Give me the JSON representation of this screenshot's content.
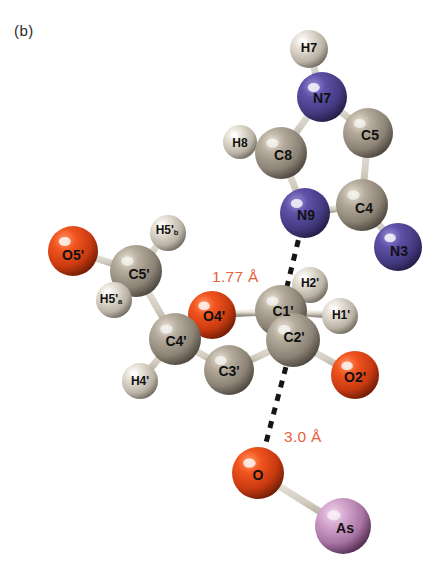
{
  "figure": {
    "panel_label": "(b)",
    "type": "ball-and-stick molecular structure",
    "background_color": "#ffffff"
  },
  "palette": {
    "carbon": "#9a9084",
    "nitrogen": "#4b3f8f",
    "oxygen": "#e8411a",
    "hydrogen": "#d8d3c8",
    "arsenic": "#c89ac0",
    "bond": "#cfcac0",
    "dashed_bond": "#151515",
    "distance_text": "#e8603c",
    "label_text": "#111111"
  },
  "distances": [
    {
      "id": "dist-n9-c1prime",
      "text": "1.77 Å",
      "x": 212,
      "y": 268,
      "pairs": "N9···C1'"
    },
    {
      "id": "dist-c2prime-o",
      "text": "3.0 Å",
      "x": 284,
      "y": 428,
      "pairs": "C2'···O"
    }
  ],
  "atoms": [
    {
      "id": "H7",
      "label": "H7",
      "sub": "",
      "element": "H",
      "x": 309,
      "y": 49,
      "r": 19,
      "fs": 13,
      "lx": 309,
      "ly": 47
    },
    {
      "id": "N7",
      "label": "N7",
      "sub": "",
      "element": "N",
      "x": 322,
      "y": 97,
      "r": 25,
      "fs": 14,
      "lx": 322,
      "ly": 98
    },
    {
      "id": "C5",
      "label": "C5",
      "sub": "",
      "element": "C",
      "x": 368,
      "y": 133,
      "r": 25,
      "fs": 14,
      "lx": 370,
      "ly": 135
    },
    {
      "id": "C8",
      "label": "C8",
      "sub": "",
      "element": "C",
      "x": 281,
      "y": 153,
      "r": 26,
      "fs": 14,
      "lx": 283,
      "ly": 155
    },
    {
      "id": "H8",
      "label": "H8",
      "sub": "",
      "element": "H",
      "x": 240,
      "y": 142,
      "r": 17,
      "fs": 12,
      "lx": 240,
      "ly": 143
    },
    {
      "id": "C4",
      "label": "C4",
      "sub": "",
      "element": "C",
      "x": 362,
      "y": 205,
      "r": 26,
      "fs": 14,
      "lx": 364,
      "ly": 208
    },
    {
      "id": "N9",
      "label": "N9",
      "sub": "",
      "element": "N",
      "x": 305,
      "y": 213,
      "r": 25,
      "fs": 14,
      "lx": 306,
      "ly": 215
    },
    {
      "id": "N3",
      "label": "N3",
      "sub": "",
      "element": "N",
      "x": 398,
      "y": 247,
      "r": 24,
      "fs": 14,
      "lx": 399,
      "ly": 251
    },
    {
      "id": "H5pb",
      "label": "H5'",
      "sub": "b",
      "element": "H",
      "x": 168,
      "y": 233,
      "r": 18,
      "fs": 12,
      "lx": 167,
      "ly": 230
    },
    {
      "id": "O5p",
      "label": "O5'",
      "sub": "",
      "element": "O",
      "x": 73,
      "y": 251,
      "r": 25,
      "fs": 14,
      "lx": 73,
      "ly": 255
    },
    {
      "id": "C5p",
      "label": "C5'",
      "sub": "",
      "element": "C",
      "x": 136,
      "y": 271,
      "r": 26,
      "fs": 14,
      "lx": 139,
      "ly": 274
    },
    {
      "id": "H5pa",
      "label": "H5'",
      "sub": "a",
      "element": "H",
      "x": 114,
      "y": 300,
      "r": 18,
      "fs": 12,
      "lx": 111,
      "ly": 299
    },
    {
      "id": "H2p",
      "label": "H2'",
      "sub": "",
      "element": "H",
      "x": 310,
      "y": 285,
      "r": 18,
      "fs": 12,
      "lx": 310,
      "ly": 283
    },
    {
      "id": "O4p",
      "label": "O4'",
      "sub": "",
      "element": "O",
      "x": 212,
      "y": 315,
      "r": 24,
      "fs": 14,
      "lx": 214,
      "ly": 316
    },
    {
      "id": "C1p",
      "label": "C1'",
      "sub": "",
      "element": "C",
      "x": 281,
      "y": 311,
      "r": 26,
      "fs": 14,
      "lx": 283,
      "ly": 311
    },
    {
      "id": "H1p",
      "label": "H1'",
      "sub": "",
      "element": "H",
      "x": 340,
      "y": 316,
      "r": 18,
      "fs": 12,
      "lx": 341,
      "ly": 315
    },
    {
      "id": "C4p",
      "label": "C4'",
      "sub": "",
      "element": "C",
      "x": 175,
      "y": 339,
      "r": 26,
      "fs": 14,
      "lx": 176,
      "ly": 341
    },
    {
      "id": "C2p",
      "label": "C2'",
      "sub": "",
      "element": "C",
      "x": 293,
      "y": 340,
      "r": 27,
      "fs": 14,
      "lx": 294,
      "ly": 337
    },
    {
      "id": "C3p",
      "label": "C3'",
      "sub": "",
      "element": "C",
      "x": 229,
      "y": 370,
      "r": 25,
      "fs": 14,
      "lx": 229,
      "ly": 371
    },
    {
      "id": "H4p",
      "label": "H4'",
      "sub": "",
      "element": "H",
      "x": 140,
      "y": 381,
      "r": 18,
      "fs": 12,
      "lx": 140,
      "ly": 381
    },
    {
      "id": "O2p",
      "label": "O2'",
      "sub": "",
      "element": "O",
      "x": 355,
      "y": 375,
      "r": 24,
      "fs": 14,
      "lx": 355,
      "ly": 377
    },
    {
      "id": "O",
      "label": "O",
      "sub": "",
      "element": "O",
      "x": 258,
      "y": 473,
      "r": 26,
      "fs": 14,
      "lx": 258,
      "ly": 475
    },
    {
      "id": "As",
      "label": "As",
      "sub": "",
      "element": "As",
      "x": 343,
      "y": 526,
      "r": 28,
      "fs": 14,
      "lx": 345,
      "ly": 528
    }
  ],
  "bonds": [
    {
      "a": "H7",
      "b": "N7",
      "style": "solid"
    },
    {
      "a": "N7",
      "b": "C5",
      "style": "solid"
    },
    {
      "a": "N7",
      "b": "C8",
      "style": "solid"
    },
    {
      "a": "C8",
      "b": "H8",
      "style": "solid"
    },
    {
      "a": "C8",
      "b": "N9",
      "style": "solid"
    },
    {
      "a": "C5",
      "b": "C4",
      "style": "solid"
    },
    {
      "a": "C4",
      "b": "N9",
      "style": "solid"
    },
    {
      "a": "C4",
      "b": "N3",
      "style": "solid"
    },
    {
      "a": "N9",
      "b": "C1p",
      "style": "dashed"
    },
    {
      "a": "O5p",
      "b": "C5p",
      "style": "solid"
    },
    {
      "a": "C5p",
      "b": "H5pb",
      "style": "solid"
    },
    {
      "a": "C5p",
      "b": "H5pa",
      "style": "solid"
    },
    {
      "a": "C5p",
      "b": "C4p",
      "style": "solid"
    },
    {
      "a": "C4p",
      "b": "O4p",
      "style": "solid"
    },
    {
      "a": "C4p",
      "b": "H4p",
      "style": "solid"
    },
    {
      "a": "C4p",
      "b": "C3p",
      "style": "solid"
    },
    {
      "a": "O4p",
      "b": "C1p",
      "style": "solid"
    },
    {
      "a": "C1p",
      "b": "H2p",
      "style": "solid"
    },
    {
      "a": "C1p",
      "b": "H1p",
      "style": "solid"
    },
    {
      "a": "C1p",
      "b": "C2p",
      "style": "solid"
    },
    {
      "a": "C2p",
      "b": "C3p",
      "style": "solid"
    },
    {
      "a": "C2p",
      "b": "O2p",
      "style": "solid"
    },
    {
      "a": "C2p",
      "b": "O",
      "style": "dashed"
    },
    {
      "a": "O",
      "b": "As",
      "style": "solid"
    }
  ]
}
